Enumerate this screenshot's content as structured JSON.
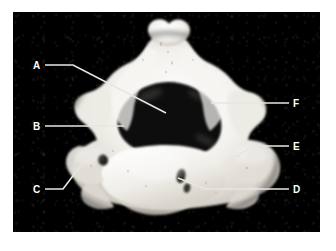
{
  "figure": {
    "kind": "anatomical-photograph",
    "background_color": "#000000",
    "mount_color": "#ffffff",
    "bone_color": "#f2f0ec",
    "leader_line_color": "#e8e6e2",
    "label_color": "#ffffff",
    "plate": {
      "x": 13,
      "y": 12,
      "width": 307,
      "height": 220
    }
  },
  "labels": [
    {
      "id": "A",
      "text": "A",
      "label_x": 33,
      "label_y": 61,
      "leader": [
        [
          45,
          65
        ],
        [
          73,
          65
        ],
        [
          166,
          113
        ]
      ]
    },
    {
      "id": "B",
      "text": "B",
      "label_x": 33,
      "label_y": 122,
      "leader": [
        [
          45,
          126
        ],
        [
          124,
          126
        ]
      ]
    },
    {
      "id": "C",
      "text": "C",
      "label_x": 33,
      "label_y": 185,
      "leader": [
        [
          45,
          189
        ],
        [
          63,
          189
        ],
        [
          88,
          156
        ]
      ]
    },
    {
      "id": "D",
      "text": "D",
      "label_x": 293,
      "label_y": 185,
      "leader": [
        [
          289,
          189
        ],
        [
          205,
          189
        ],
        [
          178,
          178
        ]
      ]
    },
    {
      "id": "E",
      "text": "E",
      "label_x": 293,
      "label_y": 142,
      "leader": [
        [
          289,
          146
        ],
        [
          253,
          146
        ],
        [
          223,
          164
        ]
      ]
    },
    {
      "id": "F",
      "text": "F",
      "label_x": 293,
      "label_y": 99,
      "leader": [
        [
          289,
          103
        ],
        [
          211,
          103
        ]
      ]
    }
  ]
}
